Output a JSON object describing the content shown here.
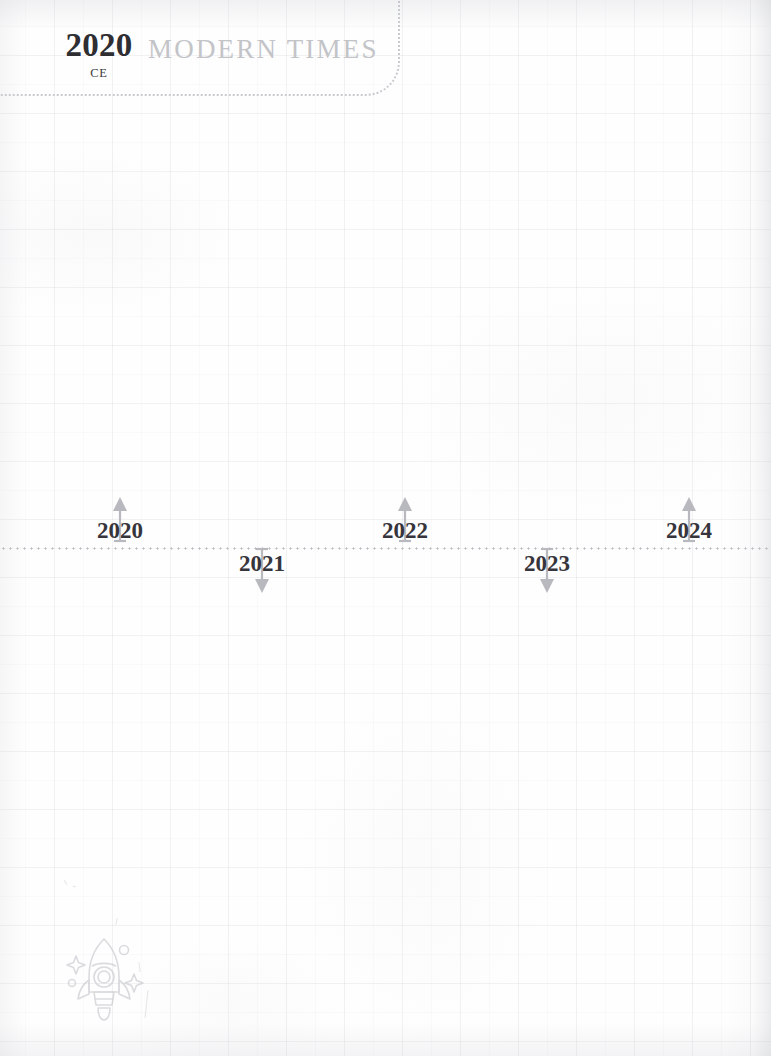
{
  "page": {
    "background_color": "#fefefe",
    "grid_color": "#96a0a8",
    "width": 771,
    "height": 1056
  },
  "header": {
    "era_year": "2020",
    "era_suffix": "CE",
    "era_title": "MODERN TIMES",
    "year_color": "#2e2e33",
    "title_color": "#c3c4c8",
    "border_color": "#c9cbd0"
  },
  "timeline": {
    "axis_color": "#b9bbc0",
    "axis_y": 547,
    "arrow_color": "#b7b9bf",
    "label_color": "#35353b",
    "ticks": [
      {
        "label": "2020",
        "x": 120,
        "direction": "up"
      },
      {
        "label": "2021",
        "x": 262,
        "direction": "down"
      },
      {
        "label": "2022",
        "x": 405,
        "direction": "up"
      },
      {
        "label": "2023",
        "x": 547,
        "direction": "down"
      },
      {
        "label": "2024",
        "x": 689,
        "direction": "up"
      }
    ]
  },
  "decoration": {
    "rocket_icon": "rocket-icon",
    "rocket_color": "#c5c7cc"
  }
}
